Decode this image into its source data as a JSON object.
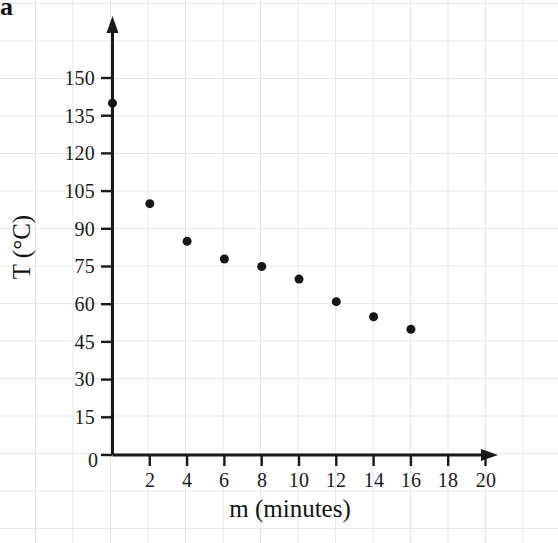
{
  "part_label": "a",
  "chart_data": {
    "type": "scatter",
    "title": "",
    "xlabel": "m (minutes)",
    "ylabel": "T (°C)",
    "xlim": [
      0,
      21.5
    ],
    "ylim": [
      0,
      158
    ],
    "grid": true,
    "legend": "none",
    "x": [
      0,
      2,
      4,
      6,
      8,
      10,
      12,
      14,
      16
    ],
    "y": [
      140,
      100,
      85,
      78,
      75,
      70,
      61,
      55,
      50
    ],
    "points": [
      {
        "m": 0,
        "T": 140
      },
      {
        "m": 2,
        "T": 100
      },
      {
        "m": 4,
        "T": 85
      },
      {
        "m": 6,
        "T": 78
      },
      {
        "m": 8,
        "T": 75
      },
      {
        "m": 10,
        "T": 70
      },
      {
        "m": 12,
        "T": 61
      },
      {
        "m": 14,
        "T": 55
      },
      {
        "m": 16,
        "T": 50
      }
    ],
    "xticks": [
      0,
      2,
      4,
      6,
      8,
      10,
      12,
      14,
      16,
      18,
      20
    ],
    "xtick_labels": [
      "0",
      "2",
      "4",
      "6",
      "8",
      "10",
      "12",
      "14",
      "16",
      "18",
      "20"
    ],
    "yticks": [
      0,
      15,
      30,
      45,
      60,
      75,
      90,
      105,
      120,
      135,
      150
    ],
    "ytick_labels": [
      "0",
      "15",
      "30",
      "45",
      "60",
      "75",
      "90",
      "105",
      "120",
      "135",
      "150"
    ],
    "marker": {
      "shape": "circle",
      "color": "#161616",
      "size_px": 9
    },
    "axis_color": "#1a1a1a",
    "grid_color": "#e6e6e6",
    "background": "#ffffff",
    "x_axis_arrow": true,
    "y_axis_arrow": true
  }
}
